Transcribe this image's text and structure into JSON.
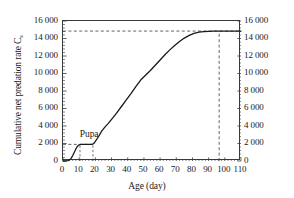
{
  "chart_data": {
    "type": "line",
    "title": "",
    "xlabel": "Age (day)",
    "ylabel": "Cumulative net predation rate C",
    "ylabel_subscript": "s",
    "xlim": [
      0,
      110
    ],
    "ylim": [
      0,
      16000
    ],
    "xticks": [
      0,
      10,
      20,
      30,
      40,
      50,
      60,
      70,
      80,
      90,
      100,
      110
    ],
    "xticklabels": [
      "0",
      "10",
      "20",
      "30",
      "40",
      "50",
      "60",
      "70",
      "80",
      "90",
      "100",
      "110"
    ],
    "yticks": [
      0,
      2000,
      4000,
      6000,
      8000,
      10000,
      12000,
      14000,
      16000
    ],
    "yticklabels": [
      "0",
      "2 000",
      "4 000",
      "6 000",
      "8 000",
      "10 000",
      "12 000",
      "14 000",
      "16 000"
    ],
    "y_axis_mirrored": true,
    "grid": false,
    "legend": null,
    "minor_ticks_per_interval": 5,
    "line_color": "#1a1a1a",
    "line_width": 1.3,
    "series": [
      {
        "name": "Cumulative net predation rate",
        "x": [
          0,
          1,
          2,
          3,
          4,
          5,
          6,
          7,
          8,
          9,
          10,
          11,
          12,
          13,
          14,
          15,
          16,
          17,
          18,
          19,
          20,
          22,
          24,
          26,
          28,
          30,
          33,
          36,
          39,
          42,
          45,
          48,
          51,
          54,
          57,
          60,
          63,
          66,
          69,
          72,
          75,
          78,
          81,
          84,
          87,
          90,
          93,
          96,
          99,
          102,
          105,
          108,
          110
        ],
        "y": [
          0,
          0,
          10,
          40,
          120,
          300,
          620,
          1000,
          1400,
          1700,
          1850,
          1900,
          1900,
          1900,
          1900,
          1900,
          1900,
          1900,
          1900,
          2000,
          2250,
          2800,
          3450,
          3900,
          4300,
          4750,
          5450,
          6200,
          6950,
          7700,
          8500,
          9250,
          9800,
          10350,
          10950,
          11550,
          12150,
          12700,
          13200,
          13650,
          14050,
          14350,
          14580,
          14720,
          14790,
          14820,
          14840,
          14850,
          14850,
          14850,
          14850,
          14850,
          14850
        ]
      }
    ],
    "annotations": [
      {
        "name": "pupa-label",
        "text": "Pupa",
        "x": 11,
        "y": 3100
      },
      {
        "name": "pupa-box",
        "type": "dashed-rect",
        "x0": 10.5,
        "x1": 18.5,
        "y0": 0,
        "y1": 1900
      },
      {
        "name": "saturation-hline",
        "type": "dashed-hline",
        "y": 14850,
        "x0": 0,
        "x1": 110
      },
      {
        "name": "saturation-vline",
        "type": "dashed-vline",
        "x": 96.5,
        "y0": 0,
        "y1": 14850
      },
      {
        "name": "pupa-hline",
        "type": "dashed-hline",
        "y": 1900,
        "x0": 0,
        "x1": 18.5
      }
    ]
  }
}
